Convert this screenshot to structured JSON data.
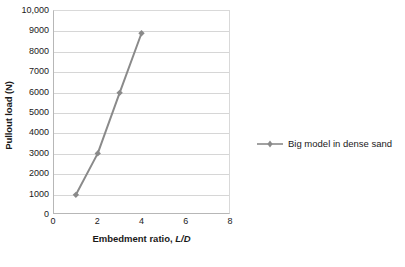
{
  "chart_data": {
    "type": "line",
    "title": "",
    "xlabel": "Embedment ratio, L/D",
    "xlabel_plain": "Embedment ratio,",
    "xlabel_italic": "L/D",
    "ylabel": "Pullout load (N)",
    "xlim": [
      0,
      8
    ],
    "ylim": [
      0,
      10000
    ],
    "grid": "horizontal",
    "legend_position": "right",
    "x_ticks": [
      "0",
      "2",
      "4",
      "6",
      "8"
    ],
    "x_tick_values": [
      0,
      2,
      4,
      6,
      8
    ],
    "y_ticks": [
      "0",
      "1000",
      "2000",
      "3000",
      "4000",
      "5000",
      "6000",
      "7000",
      "8000",
      "9000",
      "10,000"
    ],
    "y_tick_values": [
      0,
      1000,
      2000,
      3000,
      4000,
      5000,
      6000,
      7000,
      8000,
      9000,
      10000
    ],
    "series": [
      {
        "name": "Big model in dense sand",
        "color": "#8a8a8a",
        "marker": "diamond",
        "x": [
          1,
          2,
          3,
          4
        ],
        "values": [
          900,
          2950,
          5950,
          8900
        ]
      }
    ]
  },
  "legend": {
    "entries": [
      {
        "label": "Big model in dense sand",
        "color": "#8a8a8a"
      }
    ]
  },
  "colors": {
    "series": "#8a8a8a",
    "grid": "#d6d6d6",
    "axis": "#b7b7b7",
    "background": "#ffffff",
    "text": "#1a1a1a"
  }
}
